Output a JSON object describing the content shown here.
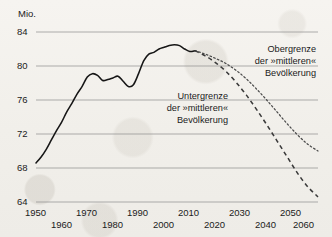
{
  "chart_data": {
    "type": "line",
    "title": "",
    "unit_label": "Mio.",
    "xlabel": "",
    "ylabel": "Mio.",
    "xlim": [
      1950,
      2060
    ],
    "ylim": [
      64,
      84
    ],
    "yticks": [
      64,
      68,
      72,
      76,
      80,
      84
    ],
    "xticks": [
      1950,
      1960,
      1970,
      1980,
      1990,
      2000,
      2010,
      2020,
      2030,
      2040,
      2050,
      2060
    ],
    "grid": "horizontal",
    "legend_position": "inline-annotations",
    "series": [
      {
        "name": "Bevölkerung (Ist)",
        "style": "solid",
        "x": [
          1950,
          1952,
          1954,
          1956,
          1958,
          1960,
          1962,
          1964,
          1966,
          1968,
          1970,
          1972,
          1974,
          1976,
          1978,
          1980,
          1982,
          1984,
          1986,
          1988,
          1990,
          1992,
          1994,
          1996,
          1998,
          2000,
          2002,
          2004,
          2006,
          2008,
          2010,
          2012
        ],
        "values": [
          68.6,
          69.3,
          70.2,
          71.3,
          72.4,
          73.4,
          74.6,
          75.6,
          76.7,
          77.6,
          78.7,
          79.1,
          78.9,
          78.3,
          78.4,
          78.6,
          78.8,
          78.2,
          77.6,
          77.8,
          79.1,
          80.6,
          81.4,
          81.6,
          82.0,
          82.2,
          82.4,
          82.5,
          82.4,
          82.0,
          81.7,
          81.8
        ]
      },
      {
        "name": "Obergrenze der »mittleren« Bevölkerung",
        "style": "dotted",
        "x": [
          2012,
          2016,
          2020,
          2024,
          2028,
          2032,
          2036,
          2040,
          2044,
          2048,
          2052,
          2056,
          2060
        ],
        "values": [
          81.8,
          81.4,
          80.9,
          80.3,
          79.5,
          78.5,
          77.3,
          76.0,
          74.6,
          73.2,
          71.9,
          70.8,
          70.0
        ]
      },
      {
        "name": "Untergrenze der »mittleren« Bevölkerung",
        "style": "dashed",
        "x": [
          2012,
          2016,
          2020,
          2024,
          2028,
          2032,
          2036,
          2040,
          2044,
          2048,
          2052,
          2056,
          2060
        ],
        "values": [
          81.8,
          81.2,
          80.4,
          79.4,
          78.1,
          76.6,
          74.9,
          73.1,
          71.2,
          69.3,
          67.4,
          65.8,
          64.6
        ]
      }
    ],
    "annotations": [
      {
        "id": "upper-annotation",
        "lines": [
          "Obergrenze",
          "der »mittleren«",
          "Bevölkerung"
        ]
      },
      {
        "id": "lower-annotation",
        "lines": [
          "Untergrenze",
          "der »mittleren«",
          "Bevölkerung"
        ]
      }
    ]
  },
  "axis": {
    "y_tick_84": "84",
    "y_tick_80": "80",
    "y_tick_76": "76",
    "y_tick_72": "72",
    "y_tick_68": "68",
    "y_tick_64": "64",
    "unit": "Mio.",
    "x_tick_1950": "1950",
    "x_tick_1960": "1960",
    "x_tick_1970": "1970",
    "x_tick_1980": "1980",
    "x_tick_1990": "1990",
    "x_tick_2000": "2000",
    "x_tick_2010": "2010",
    "x_tick_2020": "2020",
    "x_tick_2030": "2030",
    "x_tick_2040": "2040",
    "x_tick_2050": "2050",
    "x_tick_2060": "2060"
  },
  "annotations": {
    "upper": {
      "line1": "Obergrenze",
      "line2": "der »mittleren«",
      "line3": "Bevölkerung"
    },
    "lower": {
      "line1": "Untergrenze",
      "line2": "der »mittleren«",
      "line3": "Bevölkerung"
    }
  },
  "colors": {
    "ink": "#1b1b1b",
    "grid": "#8d8d8d",
    "paper": "#f4f2ee"
  }
}
